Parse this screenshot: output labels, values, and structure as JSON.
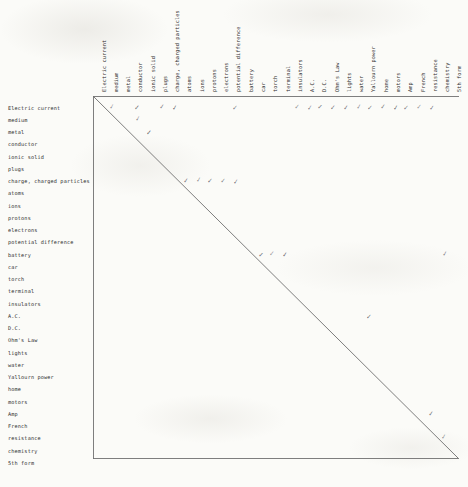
{
  "document": {
    "kind": "co-occurrence-matrix",
    "medium": "scanned handwritten annotation on paper",
    "title": "",
    "ink_color": "#3a3a46",
    "rule_color": "#6a6a6a",
    "paper_color": "#fbfbf8"
  },
  "chart_data": {
    "type": "heatmap",
    "title": "",
    "xlabel": "",
    "ylabel": "",
    "categories": [
      "Electric current",
      "medium",
      "metal",
      "conductor",
      "ionic solid",
      "plugs",
      "charge, charged particles",
      "atoms",
      "ions",
      "protons",
      "electrons",
      "potential difference",
      "battery",
      "car",
      "torch",
      "terminal",
      "insulators",
      "A.C.",
      "D.C.",
      "Ohm's Law",
      "lights",
      "water",
      "Yallourn power",
      "home",
      "motors",
      "Amp",
      "French",
      "resistance",
      "chemistry",
      "5th form"
    ],
    "row_labels": [
      "Electric current",
      "medium",
      "metal",
      "conductor",
      "ionic solid",
      "plugs",
      "charge, charged particles",
      "atoms",
      "ions",
      "protons",
      "electrons",
      "potential difference",
      "battery",
      "car",
      "torch",
      "terminal",
      "insulators",
      "A.C.",
      "D.C.",
      "Ohm's Law",
      "lights",
      "water",
      "Yallourn power",
      "home",
      "motors",
      "Amp",
      "French",
      "resistance",
      "chemistry",
      "5th form"
    ],
    "column_labels": [
      "Electric current",
      "medium",
      "metal",
      "conductor",
      "ionic solid",
      "plugs",
      "charge, charged particles",
      "atoms",
      "ions",
      "protons",
      "electrons",
      "potential difference",
      "battery",
      "car",
      "torch",
      "terminal",
      "insulators",
      "A.C.",
      "D.C.",
      "Ohm's Law",
      "lights",
      "water",
      "Yallourn power",
      "home",
      "motors",
      "Amp",
      "French",
      "resistance",
      "chemistry",
      "5th form"
    ],
    "mark_glyph": "✓",
    "marks": [
      {
        "row": "Electric current",
        "column": "medium"
      },
      {
        "row": "Electric current",
        "column": "conductor"
      },
      {
        "row": "Electric current",
        "column": "plugs"
      },
      {
        "row": "Electric current",
        "column": "charge, charged particles"
      },
      {
        "row": "Electric current",
        "column": "potential difference"
      },
      {
        "row": "Electric current",
        "column": "insulators"
      },
      {
        "row": "Electric current",
        "column": "A.C."
      },
      {
        "row": "Electric current",
        "column": "D.C."
      },
      {
        "row": "Electric current",
        "column": "Ohm's Law"
      },
      {
        "row": "Electric current",
        "column": "lights"
      },
      {
        "row": "Electric current",
        "column": "water"
      },
      {
        "row": "Electric current",
        "column": "Yallourn power"
      },
      {
        "row": "Electric current",
        "column": "home"
      },
      {
        "row": "Electric current",
        "column": "motors"
      },
      {
        "row": "Electric current",
        "column": "Amp"
      },
      {
        "row": "Electric current",
        "column": "French"
      },
      {
        "row": "Electric current",
        "column": "resistance"
      },
      {
        "row": "medium",
        "column": "conductor"
      },
      {
        "row": "metal",
        "column": "ionic solid"
      },
      {
        "row": "charge, charged particles",
        "column": "atoms"
      },
      {
        "row": "charge, charged particles",
        "column": "ions"
      },
      {
        "row": "charge, charged particles",
        "column": "protons"
      },
      {
        "row": "charge, charged particles",
        "column": "electrons"
      },
      {
        "row": "charge, charged particles",
        "column": "potential difference"
      },
      {
        "row": "battery",
        "column": "car"
      },
      {
        "row": "battery",
        "column": "torch"
      },
      {
        "row": "battery",
        "column": "terminal"
      },
      {
        "row": "battery",
        "column": "chemistry"
      },
      {
        "row": "A.C.",
        "column": "Yallourn power"
      },
      {
        "row": "Amp",
        "column": "resistance"
      },
      {
        "row": "resistance",
        "column": "chemistry"
      }
    ],
    "grid": false,
    "legend": "none"
  },
  "layout": {
    "origin_x": 93,
    "origin_y": 96,
    "end_x": 459,
    "end_y": 459,
    "col_step": 12.27,
    "row_step": 12.25,
    "first_col_center": 99.5,
    "first_row_center": 108.5
  }
}
